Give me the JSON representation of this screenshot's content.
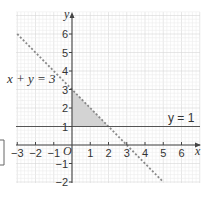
{
  "figure": {
    "axes": {
      "x_label": "x",
      "y_label": "y",
      "origin_label": "O",
      "x_ticks": [
        -3,
        -2,
        -1,
        1,
        2,
        3,
        4,
        5,
        6
      ],
      "y_ticks": [
        -2,
        -1,
        1,
        2,
        3,
        4,
        5,
        6
      ],
      "x_range": [
        -3,
        7
      ],
      "y_range": [
        -2,
        7
      ],
      "grid": true
    },
    "lines": [
      {
        "label": "x + y = 3",
        "style": "dashed",
        "from": [
          -3,
          6
        ],
        "to": [
          5,
          -2
        ]
      },
      {
        "label": "y = 1",
        "style": "solid",
        "from": [
          -3,
          1
        ],
        "to": [
          7,
          1
        ]
      }
    ],
    "shaded_region": {
      "vertices": [
        [
          0,
          1
        ],
        [
          0,
          3
        ],
        [
          2,
          1
        ]
      ],
      "color": "#d3d3d3"
    },
    "colors": {
      "grid_minor": "#ececec",
      "grid_major": "#d6d6d6",
      "axis": "#444444",
      "line": "#555555",
      "dashed": "#888888"
    }
  },
  "labels": {
    "line1": "x + y = 3",
    "line2": "y = 1",
    "x_axis": "x",
    "y_axis": "y",
    "origin": "O"
  }
}
